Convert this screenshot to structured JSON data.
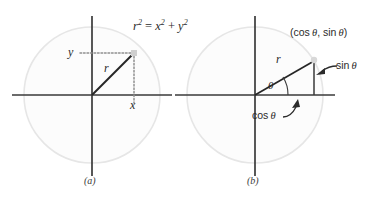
{
  "figure": {
    "background_color": "#ffffff",
    "axis_color": "#3a3a3a",
    "circle_stroke_color": "#e2e2e2",
    "circle_fill_color": "#fcfcfc",
    "radius_line_color": "#262626",
    "dotted_line_color": "#9a9a9a",
    "text_color": "#2b2b2b"
  },
  "panels": [
    {
      "id": "a",
      "caption": "(a)",
      "center": {
        "x": 92,
        "y": 95
      },
      "radius_px": 68,
      "equation": {
        "lhs_base": "r",
        "lhs_exp": "2",
        "eq_sign": "=",
        "t1_base": "x",
        "t1_exp": "2",
        "plus": "+",
        "t2_base": "y",
        "t2_exp": "2",
        "full_text": "r2 = x2 + y2"
      },
      "labels": {
        "y_label": "y",
        "r_label": "r",
        "x_label": "x"
      },
      "point": {
        "x": 134,
        "y": 53
      },
      "angle_deg": 45
    },
    {
      "id": "b",
      "caption": "(b)",
      "center": {
        "x": 255,
        "y": 95
      },
      "radius_px": 68,
      "labels": {
        "point_label_open": "(",
        "point_label_cos": "cos",
        "point_label_theta1": "θ",
        "point_label_comma": ",",
        "point_label_sin": "sin",
        "point_label_theta2": "θ",
        "point_label_close": ")",
        "point_label_full": "(cos θ, sin θ)",
        "r_label": "r",
        "theta_label": "θ",
        "sin_label_fn": "sin",
        "sin_label_arg": "θ",
        "sin_label_full": "sin θ",
        "cos_label_fn": "cos",
        "cos_label_arg": "θ",
        "cos_label_full": "cos θ"
      },
      "point": {
        "x": 312,
        "y": 59
      },
      "angle_deg": 30
    }
  ]
}
